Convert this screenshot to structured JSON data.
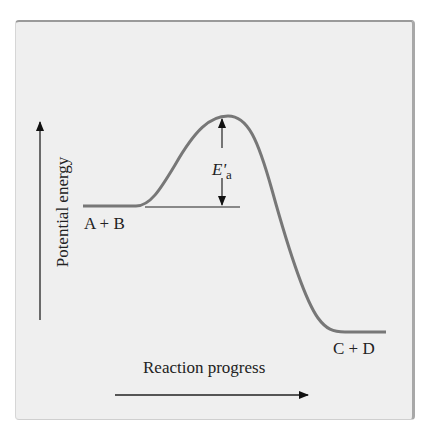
{
  "diagram": {
    "title": "",
    "y_axis_label": "Potential energy",
    "x_axis_label": "Reaction progress",
    "reactants_label": "A + B",
    "products_label": "C + D",
    "activation_energy_label": {
      "symbol": "E'",
      "subscript": "a"
    },
    "curve_color": "#777777",
    "panel_background": "#efefef"
  }
}
